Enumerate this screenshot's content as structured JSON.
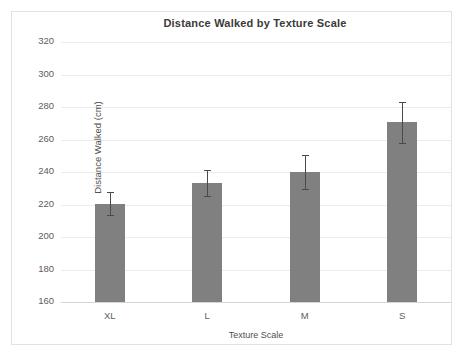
{
  "chart_data": {
    "type": "bar",
    "title": "Distance Walked by Texture Scale",
    "xlabel": "Texture Scale",
    "ylabel": "Distance Walked (cm)",
    "categories": [
      "XL",
      "L",
      "M",
      "S"
    ],
    "values": [
      220.5,
      233,
      240,
      270.5
    ],
    "errors": [
      7,
      8,
      10.5,
      12.5
    ],
    "ylim": [
      160,
      320
    ],
    "yticks": [
      160,
      180,
      200,
      220,
      240,
      260,
      280,
      300,
      320
    ],
    "ytick_labels": [
      "160",
      "180",
      "200",
      "220",
      "240",
      "260",
      "280",
      "300",
      "320"
    ],
    "grid": true,
    "legend": false,
    "bar_color": "#808080",
    "error_color": "#4a4a4a",
    "grid_color": "#ececec",
    "frame_color": "#e2e2e2",
    "title_color": "#3a3a3a",
    "tick_color": "#5d5d5d"
  }
}
